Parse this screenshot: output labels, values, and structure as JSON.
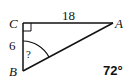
{
  "diagram": {
    "type": "right-triangle",
    "vertices": {
      "C": {
        "label": "C",
        "x": 23,
        "y": 23
      },
      "A": {
        "label": "A",
        "x": 113,
        "y": 23
      },
      "B": {
        "label": "B",
        "x": 23,
        "y": 71
      }
    },
    "side_labels": {
      "CA": "18",
      "CB": "6"
    },
    "unknown_angle_label": "?",
    "answer": "72°",
    "right_angle_at": "C",
    "stroke_color": "#111111"
  }
}
